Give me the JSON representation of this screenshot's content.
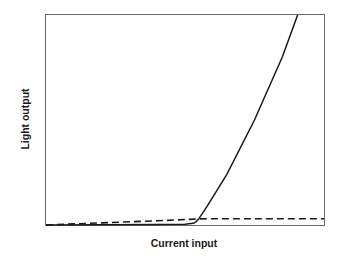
{
  "chart_data": {
    "type": "line",
    "title": "",
    "xlabel": "Current input",
    "ylabel": "Light output",
    "xlim": [
      0,
      100
    ],
    "ylim": [
      0,
      100
    ],
    "grid": false,
    "legend": null,
    "ticks": {
      "x": [],
      "y": []
    },
    "series": [
      {
        "name": "Laser output (stimulated emission above threshold)",
        "style": "solid",
        "color": "#1a1a1a",
        "x": [
          0,
          40,
          50,
          53,
          54,
          55,
          58,
          65,
          75,
          85,
          90.5
        ],
        "y": [
          0,
          0.2,
          0.4,
          0.8,
          1.5,
          3,
          9,
          24,
          50,
          80,
          100
        ]
      },
      {
        "name": "Spontaneous emission",
        "style": "dashed",
        "color": "#1a1a1a",
        "x": [
          0,
          10,
          20,
          30,
          40,
          50,
          55,
          60,
          70,
          80,
          90,
          100
        ],
        "y": [
          0,
          0.5,
          1.0,
          1.5,
          2.0,
          2.6,
          2.9,
          3.0,
          3.0,
          3.0,
          3.0,
          3.0
        ]
      }
    ],
    "annotations": []
  },
  "labels": {
    "x": "Current input",
    "y": "Light output"
  }
}
